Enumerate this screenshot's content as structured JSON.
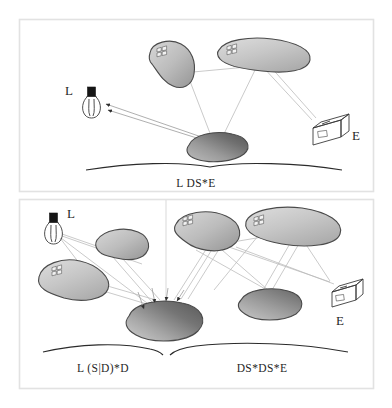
{
  "figure": {
    "background_color": "#ffffff",
    "frame_color": "#e2e2e2",
    "ray_color": "#b8b8b8"
  },
  "panels": [
    {
      "id": "top-panel",
      "path_expression_label": "L DS*E",
      "ground_label_x": 196,
      "elements": {
        "light_label": "L",
        "eye_label": "E"
      }
    },
    {
      "id": "bottom-panel",
      "path_expression_labels": [
        "L (S|D)*D",
        "DS*DS*E"
      ],
      "elements": {
        "light_label": "L",
        "eye_label": "E"
      }
    }
  ],
  "labels": {
    "top_path": "L DS*E",
    "bottom_left_path": "L (S|D)*D",
    "bottom_right_path": "DS*DS*E",
    "light_top": "L",
    "eye_top": "E",
    "light_bottom": "L",
    "eye_bottom": "E"
  },
  "icons": {
    "lightbulb": "lightbulb-icon",
    "camera": "camera-icon",
    "window_pattern": "window-pane-icon"
  },
  "colors": {
    "blob_light": "#c9c9c9",
    "blob_mid": "#b4b4b4",
    "blob_dark": "#6e6e6e",
    "outline": "#4a4a4a",
    "text": "#1f1f1f"
  }
}
